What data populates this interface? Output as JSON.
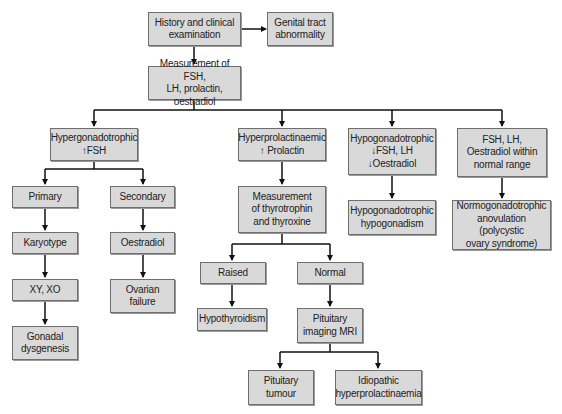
{
  "diagram": {
    "nodes": {
      "history": "History and clinical\nexamination",
      "genital": "Genital tract\nabnormality",
      "measurement": "Measurement of FSH,\nLH, prolactin, oestradiol",
      "hypergonadotrophic": "Hypergonadotrophic\n↑FSH",
      "hyperprolactinaemic": "Hyperprolactinaemic\n↑ Prolactin",
      "hypogonadotrophic": "Hypogonadotrophic\n↓FSH, LH\n↓Oestradiol",
      "normal_range": "FSH, LH,\nOestradiol within\nnormal range",
      "primary": "Primary",
      "secondary": "Secondary",
      "thyro_measure": "Measurement\nof thyrotrophin\nand thyroxine",
      "hypo_hypogonadism": "Hypogonadotrophic\nhypogonadism",
      "normogonadotrophic": "Normogonadotrophic\nanovulation (polycystic\novary syndrome)",
      "karyotype": "Karyotype",
      "oestradiol": "Oestradiol",
      "xyxo": "XY, XO",
      "ovarian": "Ovarian\nfailure",
      "gonadal": "Gonadal\ndysgenesis",
      "raised": "Raised",
      "normal": "Normal",
      "hypothyroidism": "Hypothyroidism",
      "pituitary_mri": "Pituitary\nimaging MRI",
      "pituitary_tumour": "Pituitary\ntumour",
      "idiopathic": "Idiopathic\nhyperprolactinaemia"
    },
    "colors": {
      "box_fill": "#d9d9d9",
      "box_border": "#6e6e6e",
      "line": "#111111"
    }
  }
}
